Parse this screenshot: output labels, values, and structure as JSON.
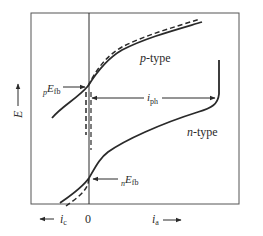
{
  "diagram": {
    "type": "current-potential curves of semiconductor electrodes",
    "axes": {
      "y_label": "E",
      "x_origin_label": "0",
      "x_left_label": "i",
      "x_left_subscript": "c",
      "x_right_label": "i",
      "x_right_subscript": "a"
    },
    "curves": [
      {
        "name": "p-type",
        "label_prefix": "p",
        "label_suffix": "-type",
        "style": "solid-and-dashed"
      },
      {
        "name": "n-type",
        "label_prefix": "n",
        "label_suffix": "-type",
        "style": "solid-and-dashed"
      }
    ],
    "annotations": {
      "p_flatband": {
        "pre_subscript": "p",
        "symbol": "E",
        "subscript": "fb"
      },
      "n_flatband": {
        "pre_subscript": "n",
        "symbol": "E",
        "subscript": "fb"
      },
      "photocurrent": {
        "symbol": "i",
        "subscript": "ph"
      }
    },
    "colors": {
      "line": "#2a2a2a",
      "frame": "#555555",
      "background": "#ffffff"
    }
  }
}
